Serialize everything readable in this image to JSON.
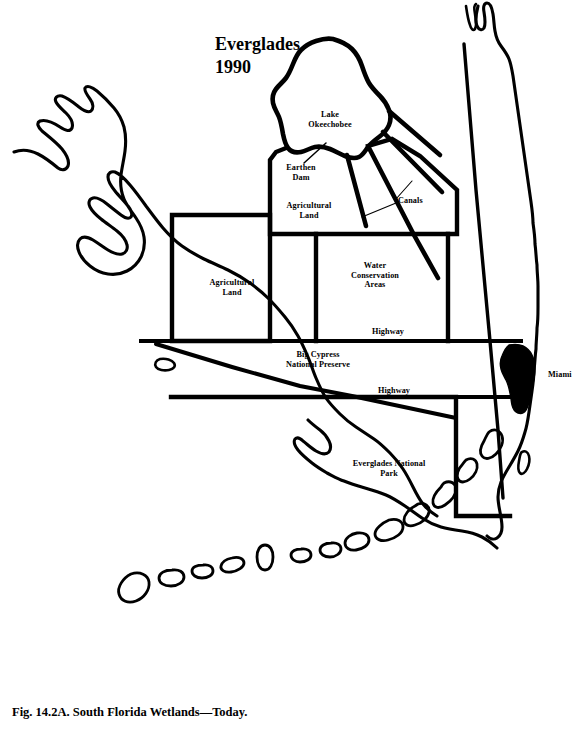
{
  "figure": {
    "title_line1": "Everglades",
    "title_line2": "1990",
    "caption": "Fig. 14.2A. South Florida Wetlands—Today.",
    "ink_color": "#000000",
    "background_color": "#ffffff"
  },
  "labels": {
    "lake": "Lake\nOkeechobee",
    "earthen_dam": "Earthen\nDam",
    "agricultural_land_north": "Agricultural\nLand",
    "canals": "Canals",
    "agricultural_land_west": "Agricultural\nLand",
    "water_conservation_areas": "Water\nConservation\nAreas",
    "highway_north": "Highway",
    "big_cypress": "Big Cypress\nNational Preserve",
    "highway_south": "Highway",
    "everglades_national_park": "Everglades National\nPark",
    "miami": "Miami"
  },
  "map_features": {
    "coastline": "south-florida-peninsula-outline",
    "lake": "lake-okeechobee",
    "urban_area": "miami-urban-area",
    "keys": "florida-keys-chain",
    "managed_areas": [
      "agricultural-land-north-boundary",
      "agricultural-land-west-boundary",
      "water-conservation-areas-boundary",
      "everglades-national-park-boundary"
    ],
    "linear_features": [
      "canal-1",
      "canal-2",
      "canal-3",
      "canal-4",
      "highway-north",
      "highway-south",
      "east-coast-canal"
    ]
  }
}
